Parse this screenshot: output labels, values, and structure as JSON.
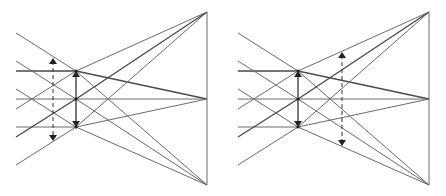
{
  "figure": {
    "panels": [
      {
        "id": "left",
        "offset_x": 0,
        "dashed_arrow_x": 53,
        "dashed_arrow_y": [
          58,
          141
        ]
      },
      {
        "id": "right",
        "offset_x": 222,
        "dashed_arrow_x": 120,
        "dashed_arrow_y": [
          52,
          146
        ]
      }
    ],
    "geometry": {
      "left_x": 16,
      "node_x": 76,
      "node_y": [
        71,
        99,
        127
      ],
      "apex_x": 207,
      "apex_y": [
        12,
        99,
        185
      ],
      "left_start_y": [
        33,
        61,
        71,
        89,
        99,
        109,
        127,
        137,
        165
      ]
    },
    "colors": {
      "line": "#6a6a6a",
      "arrow": "#222222"
    }
  }
}
